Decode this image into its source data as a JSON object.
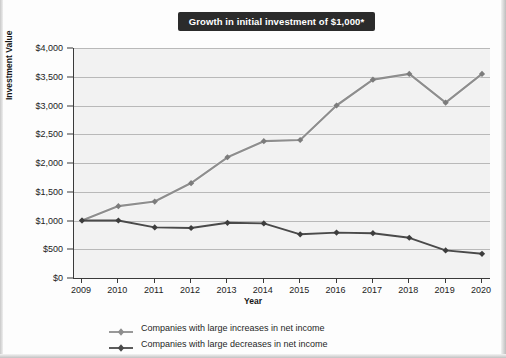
{
  "title": "Growth in initial investment of $1,000*",
  "axes": {
    "y_title": "Investment Value",
    "x_title": "Year",
    "y_ticks": [
      "$4,000",
      "$3,500",
      "$3,000",
      "$2,500",
      "$2,000",
      "$1,500",
      "$1,000",
      "$500",
      "$0"
    ]
  },
  "legend": {
    "items": [
      {
        "label": "Companies with large increases in net income",
        "color": "#8e8e8e",
        "marker": "diamond"
      },
      {
        "label": "Companies with large decreases in net income",
        "color": "#4a4a4a",
        "marker": "diamond"
      }
    ]
  },
  "chart_data": {
    "type": "line",
    "title": "Growth in initial investment of $1,000*",
    "xlabel": "Year",
    "ylabel": "Investment Value",
    "ylim": [
      0,
      4000
    ],
    "ytick_step": 500,
    "grid": true,
    "legend_position": "bottom",
    "categories": [
      "2009",
      "2010",
      "2011",
      "2012",
      "2013",
      "2014",
      "2015",
      "2016",
      "2017",
      "2018",
      "2019",
      "2020"
    ],
    "series": [
      {
        "name": "Companies with large increases in net income",
        "color": "#8e8e8e",
        "values": [
          1000,
          1250,
          1330,
          1650,
          2100,
          2380,
          2400,
          3000,
          3450,
          3550,
          3050,
          3550
        ]
      },
      {
        "name": "Companies with large decreases in net income",
        "color": "#4a4a4a",
        "values": [
          1000,
          1000,
          880,
          870,
          960,
          950,
          760,
          790,
          780,
          700,
          480,
          420
        ]
      }
    ]
  }
}
